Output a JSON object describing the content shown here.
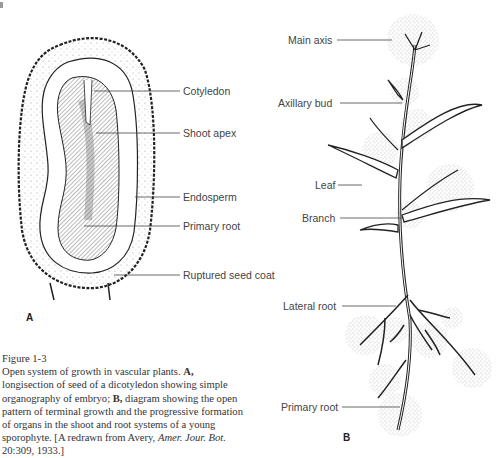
{
  "figure": {
    "panel_a_label": "A",
    "panel_b_label": "B",
    "panel_a_labels": {
      "cotyledon": "Cotyledon",
      "shoot_apex": "Shoot apex",
      "endosperm": "Endosperm",
      "primary_root": "Primary root",
      "ruptured_seed_coat": "Ruptured seed coat"
    },
    "panel_b_labels": {
      "main_axis": "Main axis",
      "axillary_bud": "Axillary bud",
      "leaf": "Leaf",
      "branch": "Branch",
      "lateral_root": "Lateral root",
      "primary_root": "Primary root"
    }
  },
  "caption": {
    "title": "Figure 1-3",
    "text_1": "Open system of growth in vascular plants. ",
    "a_ref": "A,",
    "text_2": " longisection of seed of a dicotyledon showing simple organography of embryo; ",
    "b_ref": "B,",
    "text_3": " diagram showing the open pattern of terminal growth and the progressive formation of organs in the shoot and root systems of a young sporophyte. [A redrawn from Avery, ",
    "journal": "Amer. Jour. Bot.",
    "text_4": " 20:309, 1933.]"
  }
}
